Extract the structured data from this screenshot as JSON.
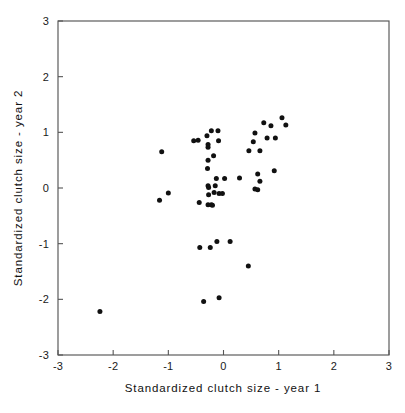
{
  "chart_data": {
    "type": "scatter",
    "title": "",
    "xlabel": "Standardized clutch size - year 1",
    "ylabel": "Standardized clutch size - year 2",
    "xlim": [
      -3,
      3
    ],
    "ylim": [
      -3,
      3
    ],
    "xticks": [
      -3,
      -2,
      -1,
      0,
      1,
      2,
      3
    ],
    "yticks": [
      -3,
      -2,
      -1,
      0,
      1,
      2,
      3
    ],
    "xtick_labels": [
      "-3",
      "-2",
      "-1",
      "0",
      "1",
      "2",
      "3"
    ],
    "ytick_labels": [
      "-3",
      "-2",
      "-1",
      "0",
      "1",
      "2",
      "3"
    ],
    "grid": false,
    "legend": false,
    "marker": "filled-circle",
    "marker_color": "#111111",
    "frame_color": "#555555",
    "background_color": "#ffffff",
    "n_points": 62,
    "points": [
      [
        -2.24,
        -2.22
      ],
      [
        -1.12,
        0.65
      ],
      [
        -1.16,
        -0.22
      ],
      [
        -1.0,
        -0.09
      ],
      [
        -0.54,
        0.85
      ],
      [
        -0.46,
        0.86
      ],
      [
        -0.3,
        0.94
      ],
      [
        -0.22,
        1.03
      ],
      [
        -0.1,
        1.03
      ],
      [
        -0.28,
        0.78
      ],
      [
        -0.28,
        0.73
      ],
      [
        -0.09,
        0.85
      ],
      [
        -0.18,
        0.58
      ],
      [
        -0.28,
        0.5
      ],
      [
        -0.29,
        0.35
      ],
      [
        -0.28,
        0.04
      ],
      [
        -0.27,
        0.01
      ],
      [
        -0.15,
        0.04
      ],
      [
        -0.17,
        -0.08
      ],
      [
        -0.27,
        -0.12
      ],
      [
        -0.13,
        0.17
      ],
      [
        0.02,
        0.17
      ],
      [
        -0.08,
        -0.1
      ],
      [
        -0.02,
        -0.1
      ],
      [
        -0.44,
        -0.26
      ],
      [
        -0.28,
        -0.3
      ],
      [
        -0.22,
        -0.3
      ],
      [
        -0.2,
        -0.31
      ],
      [
        0.29,
        0.18
      ],
      [
        0.46,
        0.67
      ],
      [
        0.54,
        0.83
      ],
      [
        0.57,
        0.99
      ],
      [
        0.66,
        0.67
      ],
      [
        0.73,
        1.17
      ],
      [
        0.79,
        0.9
      ],
      [
        0.86,
        1.12
      ],
      [
        0.94,
        0.9
      ],
      [
        1.06,
        1.26
      ],
      [
        1.13,
        1.13
      ],
      [
        0.62,
        0.25
      ],
      [
        0.66,
        0.12
      ],
      [
        0.57,
        -0.02
      ],
      [
        0.62,
        -0.03
      ],
      [
        0.92,
        0.31
      ],
      [
        -0.43,
        -1.07
      ],
      [
        -0.24,
        -1.07
      ],
      [
        -0.12,
        -0.96
      ],
      [
        0.12,
        -0.96
      ],
      [
        0.45,
        -1.4
      ],
      [
        -0.36,
        -2.04
      ],
      [
        -0.08,
        -1.97
      ]
    ]
  },
  "axes": {
    "x_title": "Standardized clutch size - year 1",
    "y_title": "Standardized clutch size - year 2"
  }
}
